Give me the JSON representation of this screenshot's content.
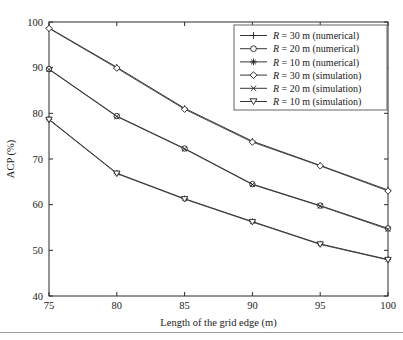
{
  "axes": {
    "xlabel": "Length of the grid edge (m)",
    "ylabel": "ACP (%)",
    "xticks": [
      "75",
      "80",
      "85",
      "90",
      "95",
      "100"
    ],
    "yticks": [
      "40",
      "50",
      "60",
      "70",
      "80",
      "90",
      "100"
    ]
  },
  "legend": {
    "items": [
      {
        "label": "R = 30 m (numerical)",
        "marker": "plus"
      },
      {
        "label": "R = 20 m (numerical)",
        "marker": "circle"
      },
      {
        "label": "R = 10 m (numerical)",
        "marker": "star"
      },
      {
        "label": "R = 30 m (simulation)",
        "marker": "diamond"
      },
      {
        "label": "R = 20 m (simulation)",
        "marker": "x"
      },
      {
        "label": "R = 10 m (simulation)",
        "marker": "triangle-down"
      }
    ]
  },
  "chart_data": {
    "type": "line",
    "title": "",
    "xlabel": "Length of the grid edge (m)",
    "ylabel": "ACP (%)",
    "xlim": [
      75,
      100
    ],
    "ylim": [
      40,
      100
    ],
    "xticks": [
      75,
      80,
      85,
      90,
      95,
      100
    ],
    "yticks": [
      40,
      50,
      60,
      70,
      80,
      90,
      100
    ],
    "grid": false,
    "legend_position": "upper-right",
    "x": [
      75,
      80,
      85,
      90,
      95,
      100
    ],
    "series": [
      {
        "name": "R = 30 m (numerical)",
        "marker": "plus",
        "values": [
          98.7,
          90.1,
          81.1,
          73.9,
          68.6,
          63.2
        ]
      },
      {
        "name": "R = 20 m (numerical)",
        "marker": "circle",
        "values": [
          89.7,
          79.4,
          72.3,
          64.5,
          59.8,
          54.8
        ]
      },
      {
        "name": "R = 10 m (numerical)",
        "marker": "star",
        "values": [
          78.7,
          66.9,
          61.3,
          56.3,
          51.4,
          48.0
        ]
      },
      {
        "name": "R = 30 m (simulation)",
        "marker": "diamond",
        "values": [
          98.6,
          89.9,
          80.9,
          73.7,
          68.5,
          63.0
        ]
      },
      {
        "name": "R = 20 m (simulation)",
        "marker": "x",
        "values": [
          89.6,
          79.3,
          72.2,
          64.4,
          59.7,
          54.6
        ]
      },
      {
        "name": "R = 10 m (simulation)",
        "marker": "triangle-down",
        "values": [
          78.6,
          66.8,
          61.2,
          56.2,
          51.3,
          47.9
        ]
      }
    ]
  }
}
